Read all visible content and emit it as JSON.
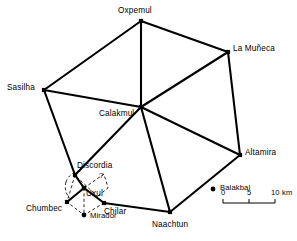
{
  "map": {
    "title": "Calakmul regional site network map",
    "line_color": "#000000",
    "background": "#ffffff",
    "sites": [
      {
        "id": "oxpemul",
        "label": "Oxpemul",
        "x": 141,
        "y": 21,
        "type": "major",
        "label_x": 118,
        "label_y": 7,
        "node": true
      },
      {
        "id": "lamuneca",
        "label": "La Muñeca",
        "x": 228,
        "y": 52,
        "type": "major",
        "label_x": 233,
        "label_y": 45,
        "node": true
      },
      {
        "id": "sasilha",
        "label": "Sasilha",
        "x": 44,
        "y": 90,
        "type": "major",
        "label_x": 7,
        "label_y": 84,
        "node": true
      },
      {
        "id": "calakmul",
        "label": "Calakmul",
        "x": 141,
        "y": 107,
        "type": "major",
        "label_x": 99,
        "label_y": 110,
        "node": true
      },
      {
        "id": "altamira",
        "label": "Altamira",
        "x": 240,
        "y": 155,
        "type": "major",
        "label_x": 245,
        "label_y": 149,
        "node": true
      },
      {
        "id": "naachtun",
        "label": "Naachtun",
        "x": 170,
        "y": 212,
        "type": "major",
        "label_x": 152,
        "label_y": 221,
        "node": true
      },
      {
        "id": "discordia",
        "label": "Discordia",
        "x": 75,
        "y": 175,
        "type": "major",
        "label_x": 77,
        "label_y": 162,
        "node": true
      },
      {
        "id": "chumbec",
        "label": "Chumbec",
        "x": 67,
        "y": 202,
        "type": "major",
        "label_x": 26,
        "label_y": 205,
        "node": true
      },
      {
        "id": "chilar",
        "label": "Chilar",
        "x": 104,
        "y": 203,
        "type": "major",
        "label_x": 104,
        "label_y": 208,
        "node": true
      },
      {
        "id": "uxul",
        "label": "Uxul",
        "x": 84,
        "y": 188,
        "type": "hub",
        "label_x": 86,
        "label_y": 190,
        "node": true
      },
      {
        "id": "mirador",
        "label": "Mirador",
        "x": 84,
        "y": 215,
        "type": "dot",
        "label_x": 90,
        "label_y": 212,
        "node": true
      },
      {
        "id": "balakbal",
        "label": "Balakbal",
        "x": 213,
        "y": 189,
        "type": "dot",
        "label_x": 220,
        "label_y": 184,
        "node": true
      }
    ],
    "solid_edges": [
      [
        "oxpemul",
        "lamuneca"
      ],
      [
        "oxpemul",
        "sasilha"
      ],
      [
        "oxpemul",
        "calakmul"
      ],
      [
        "lamuneca",
        "calakmul"
      ],
      [
        "lamuneca",
        "altamira"
      ],
      [
        "sasilha",
        "calakmul"
      ],
      [
        "sasilha",
        "discordia"
      ],
      [
        "calakmul",
        "altamira"
      ],
      [
        "calakmul",
        "naachtun"
      ],
      [
        "calakmul",
        "discordia"
      ],
      [
        "altamira",
        "naachtun"
      ],
      [
        "naachtun",
        "chilar"
      ],
      [
        "discordia",
        "uxul"
      ],
      [
        "uxul",
        "chumbec"
      ],
      [
        "uxul",
        "chilar"
      ]
    ],
    "dashed_edges": [
      [
        "uxul",
        "discordia"
      ],
      [
        "uxul",
        "chumbec"
      ],
      [
        "uxul",
        "chilar"
      ],
      [
        "uxul",
        "mirador"
      ]
    ],
    "dashed_cluster": {
      "center_x": 84,
      "center_y": 188,
      "radius": 19,
      "note": "dashed circuit linking Discordia, Chumbec, Chilar and Uxul"
    },
    "uncertainty_marker": {
      "label": "?",
      "x": 99,
      "y": 172
    },
    "scale_bar": {
      "ticks": [
        "0",
        "5",
        "10 km"
      ],
      "x": 223,
      "y": 203,
      "width": 52,
      "segments": 2
    }
  }
}
